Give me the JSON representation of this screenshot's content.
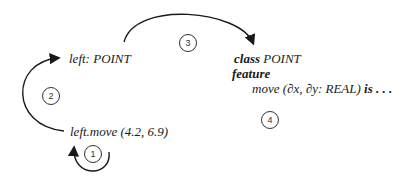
{
  "diagram": {
    "left_decl": "left: POINT",
    "call": "left.move (4.2, 6.9)",
    "class_kw": "class",
    "class_name": "POINT",
    "feature_kw": "feature",
    "routine_sig": "move (∂x, ∂y: REAL)",
    "is_kw": "is",
    "ellipsis": ". . .",
    "steps": [
      "1",
      "2",
      "3",
      "4"
    ]
  }
}
